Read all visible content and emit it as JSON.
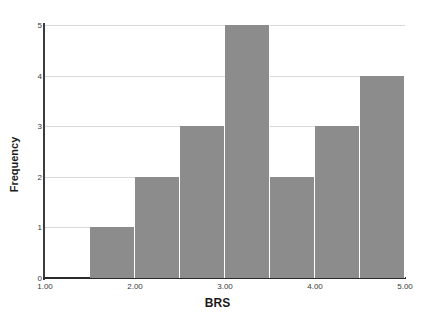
{
  "chart_data": {
    "type": "bar",
    "title": "",
    "subtitle": "",
    "xlabel": "BRS",
    "ylabel": "Frequency",
    "xlim": [
      1.0,
      5.0
    ],
    "ylim": [
      0,
      5
    ],
    "grid": true,
    "legend": null,
    "bin_width": 0.5,
    "bin_edges": [
      1.5,
      2.0,
      2.5,
      3.0,
      3.5,
      4.0,
      4.5,
      5.0
    ],
    "categories": [
      "1.5-2.0",
      "2.0-2.5",
      "2.5-3.0",
      "3.0-3.5",
      "3.5-4.0",
      "4.0-4.5",
      "4.5-5.0"
    ],
    "values": [
      1,
      2,
      3,
      5,
      2,
      3,
      4
    ],
    "bar_color": "#8c8c8c",
    "grid_color": "#d9d9d9",
    "axis_color": "#2a2a2a",
    "x_ticks": [
      "1.00",
      "2.00",
      "3.00",
      "4.00",
      "5.00"
    ],
    "x_tick_values": [
      1.0,
      2.0,
      3.0,
      4.0,
      5.0
    ],
    "y_ticks": [
      "0",
      "1",
      "2",
      "3",
      "4",
      "5"
    ],
    "y_tick_values": [
      0,
      1,
      2,
      3,
      4,
      5
    ]
  },
  "axes": {
    "x_title": "BRS",
    "y_title": "Frequency"
  }
}
